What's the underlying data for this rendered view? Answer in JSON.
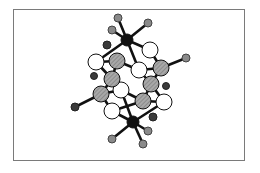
{
  "figure": {
    "type": "ball-and-stick molecular structure",
    "frame": {
      "x": 13,
      "y": 9,
      "width": 232,
      "height": 152,
      "border_color": "#7a7a7a"
    },
    "colors": {
      "metal": "#111111",
      "hatched_atom": "#9a9a9a",
      "open_atom": "#ffffff",
      "ligand_grey": "#8a8a8a",
      "ligand_dark": "#3a3a3a",
      "bond": "#111111"
    },
    "atoms": [
      {
        "id": "M1",
        "kind": "metal",
        "x": 127,
        "y": 40,
        "r": 6
      },
      {
        "id": "M2",
        "kind": "metal",
        "x": 133,
        "y": 122,
        "r": 6
      },
      {
        "id": "L1",
        "kind": "ligand_grey",
        "x": 118,
        "y": 18,
        "r": 4
      },
      {
        "id": "L2",
        "kind": "ligand_grey",
        "x": 148,
        "y": 23,
        "r": 4
      },
      {
        "id": "L3",
        "kind": "ligand_grey",
        "x": 112,
        "y": 30,
        "r": 4
      },
      {
        "id": "L4",
        "kind": "ligand_dark",
        "x": 107,
        "y": 45,
        "r": 4
      },
      {
        "id": "L5",
        "kind": "ligand_grey",
        "x": 112,
        "y": 139,
        "r": 4
      },
      {
        "id": "L6",
        "kind": "ligand_grey",
        "x": 143,
        "y": 144,
        "r": 4
      },
      {
        "id": "L7",
        "kind": "ligand_grey",
        "x": 148,
        "y": 131,
        "r": 4
      },
      {
        "id": "L8",
        "kind": "ligand_dark",
        "x": 153,
        "y": 117,
        "r": 4
      },
      {
        "id": "L9",
        "kind": "ligand_grey",
        "x": 186,
        "y": 58,
        "r": 4
      },
      {
        "id": "L10",
        "kind": "ligand_dark",
        "x": 75,
        "y": 107,
        "r": 4
      },
      {
        "id": "L11",
        "kind": "ligand_dark",
        "x": 94,
        "y": 76,
        "r": 3.5
      },
      {
        "id": "L12",
        "kind": "ligand_dark",
        "x": 166,
        "y": 86,
        "r": 3.5
      },
      {
        "id": "W1",
        "kind": "open",
        "x": 96,
        "y": 62,
        "r": 8
      },
      {
        "id": "W2",
        "kind": "open",
        "x": 150,
        "y": 50,
        "r": 8
      },
      {
        "id": "W3",
        "kind": "open",
        "x": 139,
        "y": 70,
        "r": 8
      },
      {
        "id": "W4",
        "kind": "open",
        "x": 121,
        "y": 90,
        "r": 8
      },
      {
        "id": "W5",
        "kind": "open",
        "x": 112,
        "y": 111,
        "r": 8
      },
      {
        "id": "W6",
        "kind": "open",
        "x": 164,
        "y": 102,
        "r": 8
      },
      {
        "id": "H1",
        "kind": "hatched",
        "x": 117,
        "y": 61,
        "r": 8
      },
      {
        "id": "H2",
        "kind": "hatched",
        "x": 161,
        "y": 68,
        "r": 8
      },
      {
        "id": "H3",
        "kind": "hatched",
        "x": 112,
        "y": 79,
        "r": 8
      },
      {
        "id": "H4",
        "kind": "hatched",
        "x": 151,
        "y": 84,
        "r": 8
      },
      {
        "id": "H5",
        "kind": "hatched",
        "x": 101,
        "y": 94,
        "r": 8
      },
      {
        "id": "H6",
        "kind": "hatched",
        "x": 143,
        "y": 101,
        "r": 8
      }
    ],
    "bonds": [
      [
        "M1",
        "L1"
      ],
      [
        "M1",
        "L2"
      ],
      [
        "M1",
        "L3"
      ],
      [
        "M1",
        "W1"
      ],
      [
        "M1",
        "W2"
      ],
      [
        "M1",
        "W3"
      ],
      [
        "M2",
        "L5"
      ],
      [
        "M2",
        "L6"
      ],
      [
        "M2",
        "L7"
      ],
      [
        "M2",
        "W5"
      ],
      [
        "M2",
        "W6"
      ],
      [
        "M2",
        "W4"
      ],
      [
        "H2",
        "L9"
      ],
      [
        "H5",
        "L10"
      ],
      [
        "W1",
        "H1"
      ],
      [
        "W1",
        "H3"
      ],
      [
        "H1",
        "W3"
      ],
      [
        "H1",
        "H3"
      ],
      [
        "W2",
        "H2"
      ],
      [
        "W3",
        "H2"
      ],
      [
        "W3",
        "H4"
      ],
      [
        "H3",
        "W4"
      ],
      [
        "H3",
        "H5"
      ],
      [
        "H4",
        "H2"
      ],
      [
        "H4",
        "H6"
      ],
      [
        "H4",
        "W6"
      ],
      [
        "W4",
        "H6"
      ],
      [
        "H5",
        "W5"
      ],
      [
        "W5",
        "H6"
      ],
      [
        "H6",
        "W6"
      ],
      [
        "W4",
        "H5"
      ]
    ]
  }
}
